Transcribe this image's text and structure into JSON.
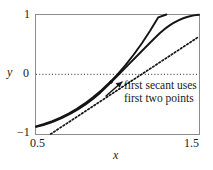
{
  "figure": {
    "annotation_line1": "first secant uses",
    "annotation_line2": "first two points"
  },
  "chart_data": {
    "type": "line",
    "title": "",
    "subtitle": "",
    "xlabel": "x",
    "ylabel": "y",
    "xlim": [
      0.5,
      1.5
    ],
    "ylim": [
      -1,
      1
    ],
    "xticks": [
      0.5,
      1.5
    ],
    "xtick_labels": [
      "0.5",
      "1.5"
    ],
    "yticks": [
      -1,
      0,
      1
    ],
    "ytick_labels": [
      "−1",
      "0",
      "1"
    ],
    "grid": false,
    "legend": "none",
    "annotations": [
      {
        "text": "first secant uses first two points",
        "line1": "first secant uses",
        "line2": "first two points",
        "x": 1.03,
        "y": -0.08,
        "leader_from": [
          0.975,
          -0.24
        ],
        "leader_to": [
          1.02,
          -0.05
        ]
      }
    ],
    "reference_lines": [
      {
        "name": "y-zero",
        "orientation": "horizontal",
        "y": 0,
        "style": "dotted"
      }
    ],
    "series": [
      {
        "name": "function-curve",
        "style": "solid",
        "color": "#141414",
        "x": [
          0.5,
          0.55,
          0.6,
          0.65,
          0.7,
          0.75,
          0.8,
          0.85,
          0.9,
          0.95,
          1.0,
          1.05,
          1.1,
          1.15,
          1.2,
          1.25,
          1.3,
          1.35,
          1.4,
          1.45,
          1.5
        ],
        "y": [
          -0.875,
          -0.833,
          -0.784,
          -0.725,
          -0.657,
          -0.578,
          -0.488,
          -0.386,
          -0.271,
          -0.143,
          0.0,
          0.158,
          0.331,
          0.52,
          0.728,
          0.953,
          1.197,
          1.46,
          1.744,
          2.049,
          1.0
        ]
      },
      {
        "name": "first-secant",
        "style": "dotted",
        "color": "#141414",
        "x": [
          0.59,
          1.5
        ],
        "y": [
          -1.0,
          0.63
        ]
      }
    ],
    "markers": [
      {
        "name": "secant-point-1",
        "x": 0.96,
        "y": -0.13
      }
    ]
  }
}
